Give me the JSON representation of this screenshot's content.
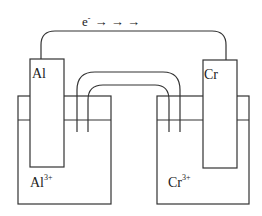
{
  "diagram": {
    "type": "galvanic-cell",
    "electron_flow": {
      "label": "e",
      "superscript": "-",
      "arrows": "→ → →"
    },
    "left_cell": {
      "electrode": "Al",
      "ion": "Al",
      "ion_charge": "3+"
    },
    "right_cell": {
      "electrode": "Cr",
      "ion": "Cr",
      "ion_charge": "3+"
    },
    "colors": {
      "stroke": "#333333",
      "background": "#ffffff"
    }
  }
}
